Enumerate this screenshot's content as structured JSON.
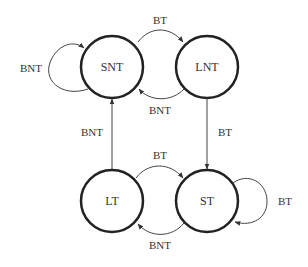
{
  "diagram": {
    "type": "state-machine",
    "states": [
      {
        "id": "SNT",
        "label": "SNT",
        "cx": 112,
        "cy": 67
      },
      {
        "id": "LNT",
        "label": "LNT",
        "cx": 207,
        "cy": 67
      },
      {
        "id": "LT",
        "label": "LT",
        "cx": 112,
        "cy": 201
      },
      {
        "id": "ST",
        "label": "ST",
        "cx": 207,
        "cy": 201
      }
    ],
    "transitions": [
      {
        "from": "SNT",
        "to": "SNT",
        "label": "BNT"
      },
      {
        "from": "SNT",
        "to": "LNT",
        "label": "BT"
      },
      {
        "from": "LNT",
        "to": "SNT",
        "label": "BNT"
      },
      {
        "from": "LNT",
        "to": "ST",
        "label": "BT"
      },
      {
        "from": "LT",
        "to": "SNT",
        "label": "BNT"
      },
      {
        "from": "LT",
        "to": "ST",
        "label": "BT"
      },
      {
        "from": "ST",
        "to": "LT",
        "label": "BNT"
      },
      {
        "from": "ST",
        "to": "ST",
        "label": "BT"
      }
    ]
  },
  "labels": {
    "snt": "SNT",
    "lnt": "LNT",
    "lt": "LT",
    "st": "ST",
    "snt_self": "BNT",
    "snt_lnt": "BT",
    "lnt_snt": "BNT",
    "lnt_st": "BT",
    "lt_snt": "BNT",
    "lt_st": "BT",
    "st_lt": "BNT",
    "st_self": "BT"
  },
  "colors": {
    "stroke": "#222222",
    "arrow": "#444444",
    "text": "#333333"
  }
}
